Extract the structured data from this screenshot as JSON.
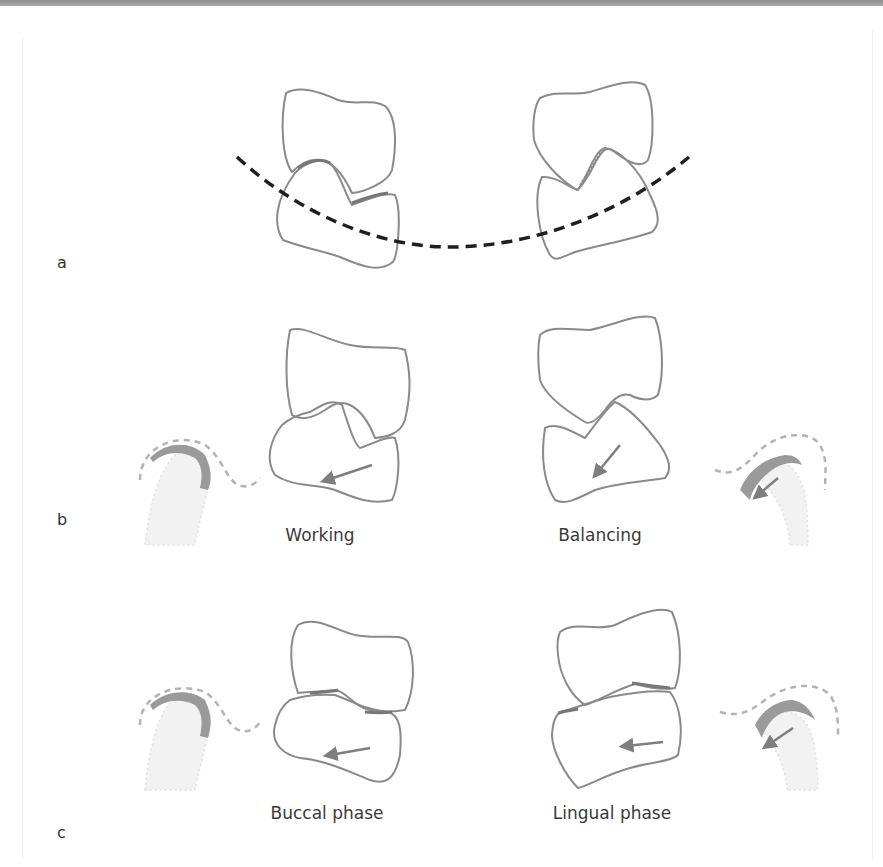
{
  "figure": {
    "panels": [
      {
        "id": "a",
        "label": "a",
        "captions": []
      },
      {
        "id": "b",
        "label": "b",
        "captions": [
          "Working",
          "Balancing"
        ]
      },
      {
        "id": "c",
        "label": "c",
        "captions": [
          "Buccal phase",
          "Lingual phase"
        ]
      }
    ]
  },
  "colors": {
    "tooth_outline": "#8a8a8a",
    "contact_mark": "#777777",
    "arrow": "#7e7e7e",
    "occlusal_curve": "#1f1f1f",
    "condyle_fill": "#ededed",
    "condyle_cap": "#9a9a9a",
    "fossa_dash": "#b3b3b3",
    "top_band": "#999999"
  },
  "icons": {
    "arrow": "movement-arrow",
    "curve": "curve-of-wilson-dashed"
  }
}
